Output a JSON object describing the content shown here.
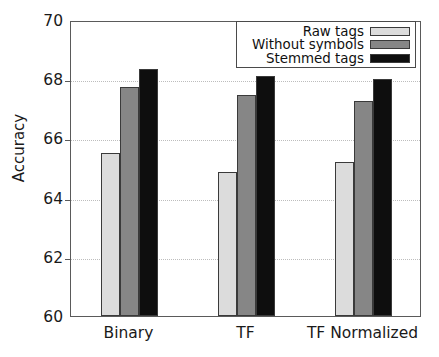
{
  "chart_data": {
    "type": "bar",
    "title": "",
    "xlabel": "",
    "ylabel": "Accuracy",
    "ylim": [
      60,
      70
    ],
    "yticks": [
      60,
      62,
      64,
      66,
      68,
      70
    ],
    "grid": true,
    "legend_position": "top-right",
    "categories": [
      "Binary",
      "TF",
      "TF Normalized"
    ],
    "series": [
      {
        "name": "Raw tags",
        "color": "#dcdcdc",
        "values": [
          65.5,
          64.85,
          65.2
        ]
      },
      {
        "name": "Without symbols",
        "color": "#868686",
        "values": [
          67.75,
          67.45,
          67.25
        ]
      },
      {
        "name": "Stemmed tags",
        "color": "#0e0e0e",
        "values": [
          68.35,
          68.1,
          68.0
        ]
      }
    ]
  },
  "axes": {
    "y_title": "Accuracy",
    "y_tick_labels": [
      "70",
      "68",
      "66",
      "64",
      "62",
      "60"
    ],
    "x_tick_labels": [
      "Binary",
      "TF",
      "TF Normalized"
    ]
  },
  "legend": {
    "entries": [
      {
        "label": "Raw tags"
      },
      {
        "label": "Without symbols"
      },
      {
        "label": "Stemmed tags"
      }
    ]
  },
  "colors": {
    "raw_tags": "#dcdcdc",
    "without_symbols": "#868686",
    "stemmed_tags": "#0e0e0e",
    "frame": "#5a5a5a",
    "grid": "#bdbdbd",
    "background": "#ffffff"
  }
}
